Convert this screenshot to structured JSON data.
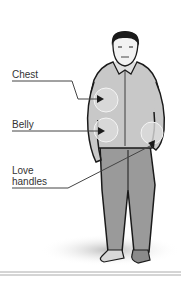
{
  "diagram": {
    "labels": [
      {
        "id": "chest",
        "text": "Chest"
      },
      {
        "id": "belly",
        "text": "Belly"
      },
      {
        "id": "love_handles",
        "text_line1": "Love",
        "text_line2": "handles"
      }
    ],
    "colors": {
      "shirt": "#c8c8c8",
      "pants": "#9a9a9a",
      "outline": "#1a1a1a",
      "highlight_circle": "#dcdcdc",
      "leader_line": "#444444"
    }
  }
}
